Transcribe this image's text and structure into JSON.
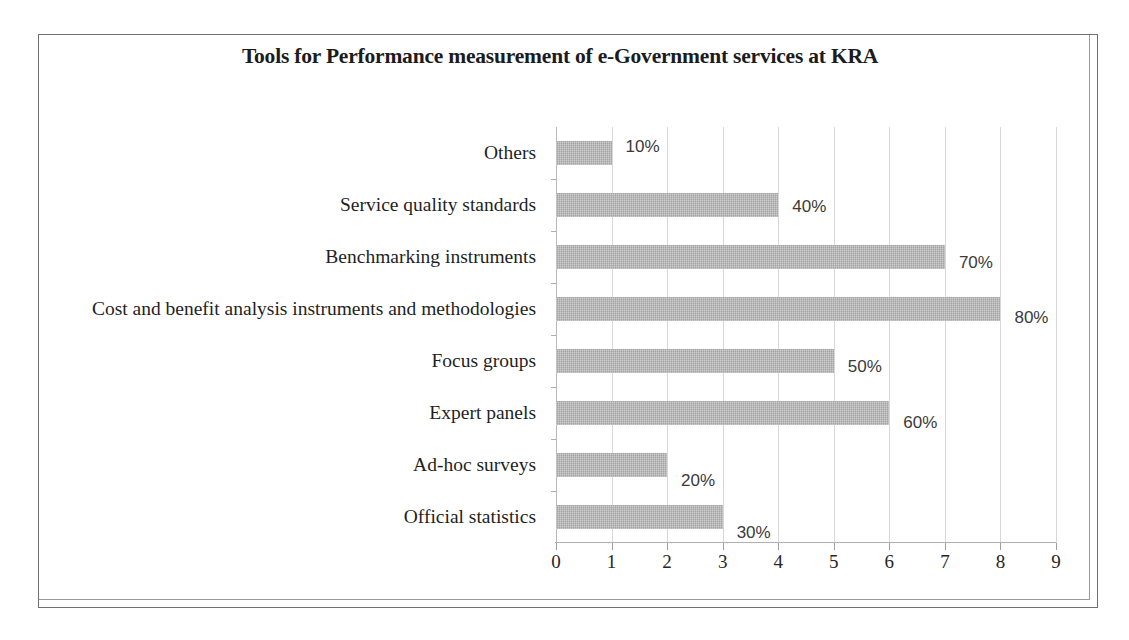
{
  "chart_data": {
    "type": "bar",
    "orientation": "horizontal",
    "title": "Tools for Performance measurement of e-Government services at KRA",
    "xlabel": "",
    "ylabel": "",
    "xlim": [
      0,
      9
    ],
    "x_ticks": [
      "0",
      "1",
      "2",
      "3",
      "4",
      "5",
      "6",
      "7",
      "8",
      "9"
    ],
    "grid": true,
    "grid_axis": "x",
    "legend": false,
    "bar_color": "#b4b4b4",
    "categories": [
      "Others",
      "Service quality standards",
      "Benchmarking instruments",
      "Cost and benefit analysis instruments and methodologies",
      "Focus groups",
      "Expert panels",
      "Ad-hoc surveys",
      "Official statistics"
    ],
    "values": [
      1,
      4,
      7,
      8,
      5,
      6,
      2,
      3
    ],
    "data_labels": [
      "10%",
      "40%",
      "70%",
      "80%",
      "50%",
      "60%",
      "20%",
      "30%"
    ],
    "series": [
      {
        "name": "Percentage of respondents",
        "values": [
          1,
          4,
          7,
          8,
          5,
          6,
          2,
          3
        ],
        "labels": [
          "10%",
          "40%",
          "70%",
          "80%",
          "50%",
          "60%",
          "20%",
          "30%"
        ]
      }
    ]
  }
}
